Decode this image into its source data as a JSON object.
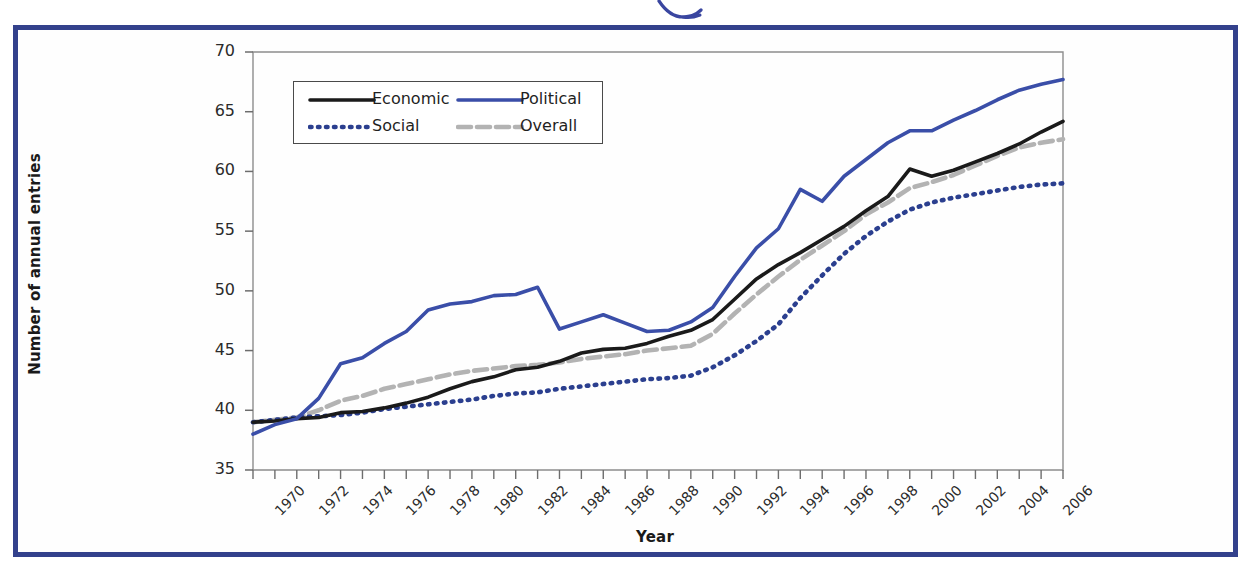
{
  "figure": {
    "border_color": "#33418c",
    "pen_mark": "blue-hook-annotation"
  },
  "chart_data": {
    "type": "line",
    "title": "",
    "xlabel": "Year",
    "ylabel": "Number of annual entries",
    "xlim": [
      1970,
      2007
    ],
    "ylim": [
      35,
      70
    ],
    "ytick_step": 5,
    "xtick_step": 1,
    "xtick_label_step": 2,
    "grid": false,
    "legend_position": "upper-left",
    "yticks": [
      "35",
      "40",
      "45",
      "50",
      "55",
      "60",
      "65",
      "70"
    ],
    "xticks": [
      "1970",
      "1971",
      "1972",
      "1973",
      "1974",
      "1975",
      "1976",
      "1977",
      "1978",
      "1979",
      "1980",
      "1981",
      "1982",
      "1983",
      "1984",
      "1985",
      "1986",
      "1987",
      "1988",
      "1989",
      "1990",
      "1991",
      "1992",
      "1993",
      "1994",
      "1995",
      "1996",
      "1997",
      "1998",
      "1999",
      "2000",
      "2001",
      "2002",
      "2003",
      "2004",
      "2005",
      "2006",
      "2007"
    ],
    "xtick_labels": [
      "1970",
      "1972",
      "1974",
      "1976",
      "1978",
      "1980",
      "1982",
      "1984",
      "1986",
      "1988",
      "1990",
      "1992",
      "1994",
      "1996",
      "1998",
      "2000",
      "2002",
      "2004",
      "2006"
    ],
    "x": [
      1970,
      1971,
      1972,
      1973,
      1974,
      1975,
      1976,
      1977,
      1978,
      1979,
      1980,
      1981,
      1982,
      1983,
      1984,
      1985,
      1986,
      1987,
      1988,
      1989,
      1990,
      1991,
      1992,
      1993,
      1994,
      1995,
      1996,
      1997,
      1998,
      1999,
      2000,
      2001,
      2002,
      2003,
      2004,
      2005,
      2006,
      2007
    ],
    "series": [
      {
        "name": "Economic",
        "color": "#1a1a1a",
        "style": "solid",
        "values": [
          39.0,
          39.1,
          39.3,
          39.4,
          39.8,
          39.9,
          40.2,
          40.6,
          41.1,
          41.8,
          42.4,
          42.8,
          43.4,
          43.6,
          44.1,
          44.8,
          45.1,
          45.2,
          45.6,
          46.2,
          46.7,
          47.6,
          49.3,
          51.0,
          52.2,
          53.2,
          54.3,
          55.4,
          56.7,
          57.9,
          60.2,
          59.6,
          60.1,
          60.8,
          61.5,
          62.3,
          63.3,
          64.2
        ]
      },
      {
        "name": "Political",
        "color": "#3a4ea8",
        "style": "solid",
        "values": [
          38.0,
          38.8,
          39.3,
          41.0,
          43.9,
          44.4,
          45.6,
          46.6,
          48.4,
          48.9,
          49.1,
          49.6,
          49.7,
          50.3,
          46.8,
          47.4,
          48.0,
          47.3,
          46.6,
          46.7,
          47.4,
          48.6,
          51.2,
          53.6,
          55.2,
          58.5,
          57.5,
          59.6,
          61.0,
          62.4,
          63.4,
          63.4,
          64.3,
          65.1,
          66.0,
          66.8,
          67.3,
          67.7
        ]
      },
      {
        "name": "Social",
        "color": "#2b3f8f",
        "style": "dotted",
        "values": [
          39.0,
          39.2,
          39.4,
          39.5,
          39.6,
          39.8,
          40.1,
          40.3,
          40.5,
          40.7,
          40.9,
          41.2,
          41.4,
          41.5,
          41.8,
          42.0,
          42.2,
          42.4,
          42.6,
          42.7,
          42.9,
          43.6,
          44.6,
          45.8,
          47.2,
          49.4,
          51.3,
          53.1,
          54.6,
          55.8,
          56.8,
          57.4,
          57.8,
          58.1,
          58.4,
          58.7,
          58.9,
          59.0
        ]
      },
      {
        "name": "Overall",
        "color": "#b3b3b3",
        "style": "dashdot",
        "values": [
          39.0,
          39.2,
          39.4,
          40.0,
          40.8,
          41.2,
          41.8,
          42.2,
          42.6,
          43.0,
          43.3,
          43.5,
          43.7,
          43.8,
          44.0,
          44.3,
          44.5,
          44.7,
          45.0,
          45.2,
          45.4,
          46.4,
          48.1,
          49.7,
          51.2,
          52.6,
          53.8,
          55.0,
          56.4,
          57.4,
          58.6,
          59.1,
          59.7,
          60.5,
          61.3,
          62.0,
          62.4,
          62.7
        ]
      }
    ]
  },
  "legend": {
    "items": [
      {
        "label": "Economic",
        "swatch": "solid-black-line"
      },
      {
        "label": "Political",
        "swatch": "solid-blue-line"
      },
      {
        "label": "Social",
        "swatch": "dotted-blue-line"
      },
      {
        "label": "Overall",
        "swatch": "dashdot-gray-line"
      }
    ]
  }
}
